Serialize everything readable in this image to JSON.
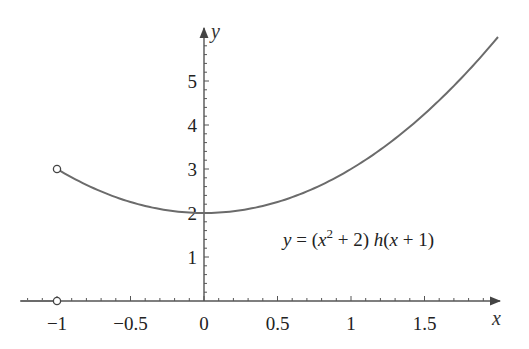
{
  "chart_data": {
    "type": "line",
    "title": "",
    "xlabel": "x",
    "ylabel": "y",
    "xlim": [
      -1.25,
      2.0
    ],
    "ylim": [
      0,
      6.0
    ],
    "grid": false,
    "legend": null,
    "x_ticks": [
      -1,
      -0.5,
      0,
      0.5,
      1,
      1.5
    ],
    "x_tick_labels": [
      "−1",
      "−0.5",
      "0",
      "0.5",
      "1",
      "1.5"
    ],
    "y_ticks": [
      1,
      2,
      3,
      4,
      5
    ],
    "y_tick_labels": [
      "1",
      "2",
      "3",
      "4",
      "5"
    ],
    "series": [
      {
        "name": "y = (x^2 + 2) h(x + 1), x < -1",
        "x": [
          -1.25,
          -1.0
        ],
        "y": [
          0,
          0
        ]
      },
      {
        "name": "y = (x^2 + 2) h(x + 1), x > -1",
        "x": [
          -1.0,
          -0.75,
          -0.5,
          -0.25,
          0,
          0.25,
          0.5,
          0.75,
          1.0,
          1.25,
          1.5,
          1.75,
          2.0
        ],
        "y": [
          3.0,
          2.5625,
          2.25,
          2.0625,
          2.0,
          2.0625,
          2.25,
          2.5625,
          3.0,
          3.5625,
          4.25,
          5.0625,
          6.0
        ]
      }
    ],
    "annotations": [
      {
        "text": "y = (x² + 2) h(x + 1)",
        "x": 1.0,
        "y": 1.5
      },
      {
        "type": "open-circle",
        "x": -1,
        "y": 3
      },
      {
        "type": "open-circle",
        "x": -1,
        "y": 0
      }
    ]
  },
  "labels": {
    "x_axis": "x",
    "y_axis": "y",
    "equation": {
      "y": "y",
      "eq": " = (",
      "x": "x",
      "sup": "2",
      "mid": " + 2) ",
      "h": "h",
      "open": "(",
      "x2": "x",
      "close": " + 1)"
    }
  },
  "colors": {
    "curve": "#6b6b6b",
    "axis": "#555555",
    "text": "#222222"
  }
}
